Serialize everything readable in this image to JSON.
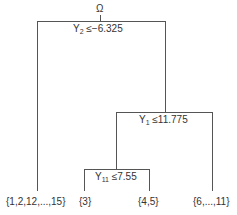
{
  "root": {
    "label": "Ω"
  },
  "splits": [
    {
      "var": "Y",
      "sub": "2",
      "op": "≤",
      "value": "−6.325"
    },
    {
      "var": "Y",
      "sub": "1",
      "op": "≤",
      "value": "11.775"
    },
    {
      "var": "Y",
      "sub": "11",
      "op": "≤",
      "value": "7.55"
    }
  ],
  "leaves": [
    {
      "label": "{1,2,12,...,15}"
    },
    {
      "label": "{3}"
    },
    {
      "label": "{4,5}"
    },
    {
      "label": "{6,...,11}"
    }
  ],
  "colors": {
    "line": "#555555",
    "text": "#333333"
  }
}
